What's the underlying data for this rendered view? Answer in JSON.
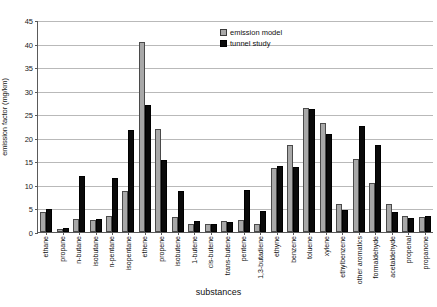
{
  "chart_data": {
    "type": "bar",
    "title": "",
    "xlabel": "substances",
    "ylabel": "emission factor (mg/km)",
    "ylim": [
      0,
      45
    ],
    "ytick_step": 5,
    "yticks": [
      0,
      5,
      10,
      15,
      20,
      25,
      30,
      35,
      40,
      45
    ],
    "grid": true,
    "legend_position": "top-center-right",
    "categories": [
      "ethane",
      "propane",
      "n-butane",
      "isobutane",
      "n-pentane",
      "isopentane",
      "ethene",
      "propene",
      "isobutene",
      "1-butene",
      "cis-butene",
      "trans-butene",
      "pentene",
      "1,3-butadiene",
      "ethyne",
      "benzene",
      "toluene",
      "xylene",
      "ethylbenzene",
      "other aromatics",
      "formaldehyde",
      "acetaldehyde",
      "propenal",
      "propanone"
    ],
    "series": [
      {
        "name": "emission model",
        "color": "#a8a8a8",
        "values": [
          4.3,
          0.6,
          2.8,
          2.6,
          3.3,
          8.7,
          40.4,
          21.8,
          3.1,
          1.8,
          1.6,
          2.3,
          2.6,
          1.6,
          13.6,
          18.4,
          26.3,
          23.2,
          5.9,
          15.6,
          10.3,
          5.9,
          3.4,
          3.2
        ]
      },
      {
        "name": "tunnel study",
        "color": "#0a0a0a",
        "values": [
          4.9,
          0.9,
          11.8,
          2.7,
          11.5,
          21.7,
          26.9,
          15.3,
          8.7,
          2.3,
          1.7,
          2.1,
          9.0,
          4.5,
          14.1,
          13.7,
          26.2,
          20.9,
          4.6,
          22.6,
          18.4,
          4.3,
          3.0,
          3.5
        ]
      }
    ]
  },
  "legend": {
    "items": [
      {
        "label": "emission model"
      },
      {
        "label": "tunnel study"
      }
    ]
  }
}
